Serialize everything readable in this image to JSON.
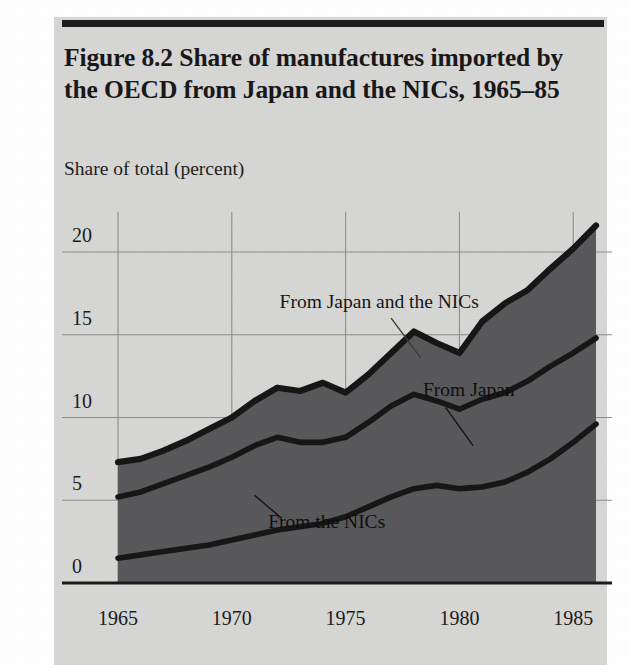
{
  "figure": {
    "title": "Figure 8.2  Share of manufactures imported by the OECD from Japan and the NICs, 1965–85",
    "title_line1": "Figure 8.2  Share of manufactures imported by",
    "title_line2": "the OECD from Japan and the NICs, 1965–85",
    "axis_caption": "Share of total (percent)",
    "background_color": "#d6d6d4",
    "area_color": "#58585a",
    "line_color": "#151515",
    "grid_color": "#8d8d8d",
    "axis_color": "#1a1a1a"
  },
  "chart_data": {
    "type": "area",
    "stacked": true,
    "title": "Figure 8.2  Share of manufactures imported by the OECD from Japan and the NICs, 1965–85",
    "subtitle": "",
    "xlabel": "",
    "ylabel": "Share of total (percent)",
    "xlim": [
      1965,
      1986
    ],
    "ylim": [
      0,
      23
    ],
    "yticks": [
      0,
      5,
      10,
      15,
      20
    ],
    "ytick_labels": [
      "0",
      "5",
      "10",
      "15",
      "20"
    ],
    "xticks": [
      1965,
      1970,
      1975,
      1980,
      1985
    ],
    "xtick_labels": [
      "1965",
      "1970",
      "1975",
      "1980",
      "1985"
    ],
    "grid": true,
    "legend_position": "inline-annotations",
    "x": [
      1965,
      1966,
      1967,
      1968,
      1969,
      1970,
      1971,
      1972,
      1973,
      1974,
      1975,
      1976,
      1977,
      1978,
      1979,
      1980,
      1981,
      1982,
      1983,
      1984,
      1985,
      1986
    ],
    "series": [
      {
        "name": "From the NICs",
        "annotation": "From the NICs",
        "values": [
          1.5,
          1.7,
          1.9,
          2.1,
          2.3,
          2.6,
          2.9,
          3.2,
          3.4,
          3.6,
          4.0,
          4.6,
          5.2,
          5.7,
          5.9,
          5.7,
          5.8,
          6.1,
          6.7,
          7.5,
          8.5,
          9.6
        ]
      },
      {
        "name": "From Japan",
        "annotation": "From Japan",
        "values": [
          3.7,
          3.8,
          4.1,
          4.4,
          4.7,
          5.0,
          5.4,
          5.6,
          5.1,
          4.9,
          4.8,
          5.1,
          5.5,
          5.7,
          5.1,
          4.8,
          5.3,
          5.4,
          5.5,
          5.6,
          5.4,
          5.2
        ]
      }
    ],
    "cumulative_total": {
      "name": "From Japan and the NICs",
      "annotation": "From Japan and the NICs",
      "values": [
        5.2,
        5.5,
        6.0,
        6.5,
        7.0,
        7.6,
        8.3,
        8.8,
        8.5,
        8.5,
        8.8,
        9.7,
        10.7,
        11.4,
        11.0,
        10.5,
        11.1,
        11.5,
        12.2,
        13.1,
        13.9,
        14.8
      ]
    },
    "top_boundary": {
      "name": "Japan plus NICs total",
      "values": [
        7.3,
        7.5,
        8.0,
        8.6,
        9.3,
        10.0,
        11.0,
        11.8,
        11.6,
        12.1,
        11.5,
        12.6,
        13.9,
        15.2,
        14.5,
        13.9,
        15.8,
        16.9,
        17.7,
        19.0,
        20.2,
        21.6
      ]
    },
    "annotations": [
      {
        "label": "From Japan and the NICs",
        "x": 1972.1,
        "y": 16.6,
        "anchor": "start"
      },
      {
        "label": "From Japan",
        "x": 1978.4,
        "y": 11.3,
        "anchor": "start"
      },
      {
        "label": "From the NICs",
        "x": 1971.6,
        "y": 3.3,
        "anchor": "start"
      }
    ]
  }
}
